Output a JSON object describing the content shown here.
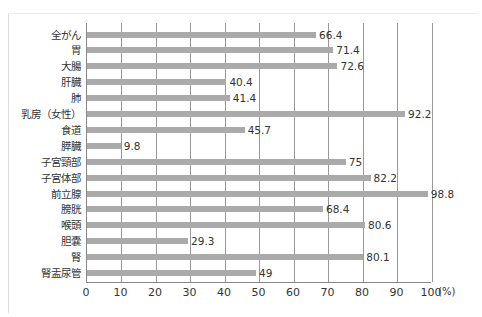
{
  "chart_data": {
    "type": "bar",
    "orientation": "horizontal",
    "title": "",
    "xlabel": "",
    "ylabel": "",
    "unit": "(%)",
    "xlim": [
      0,
      100
    ],
    "xticks": [
      "0",
      "10",
      "20",
      "30",
      "40",
      "50",
      "60",
      "70",
      "80",
      "90",
      "100"
    ],
    "grid": true,
    "bar_color": "#aaaaaa",
    "categories": [
      "全がん",
      "胃",
      "大腸",
      "肝臓",
      "肺",
      "乳房（女性）",
      "食道",
      "膵臓",
      "子宮頸部",
      "子宮体部",
      "前立腺",
      "膀胱",
      "喉頭",
      "胆嚢",
      "腎",
      "腎盂尿管"
    ],
    "values": [
      66.4,
      71.4,
      72.6,
      40.4,
      41.4,
      92.2,
      45.7,
      9.8,
      75,
      82.2,
      98.8,
      68.4,
      80.6,
      29.3,
      80.1,
      49
    ],
    "value_labels": [
      "66.4",
      "71.4",
      "72.6",
      "40.4",
      "41.4",
      "92.2",
      "45.7",
      "9.8",
      "75",
      "82.2",
      "98.8",
      "68.4",
      "80.6",
      "29.3",
      "80.1",
      "49"
    ]
  }
}
